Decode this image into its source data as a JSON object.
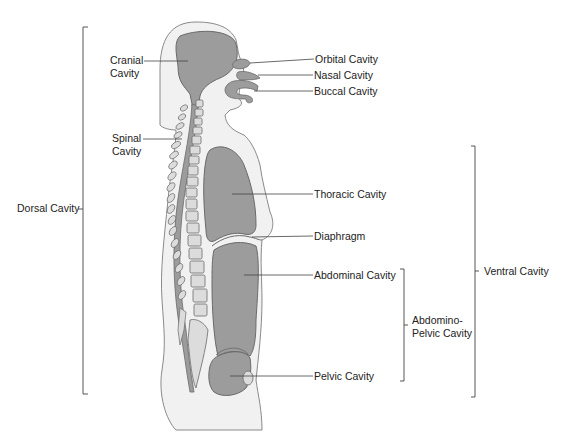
{
  "diagram": {
    "colors": {
      "background": "#ffffff",
      "body_fill": "#f1f1f1",
      "body_outline": "#8a8a8a",
      "cavity_fill": "#9c9c9c",
      "cavity_outline": "#6a6a6a",
      "vertebra_fill": "#dcdcdc",
      "line": "#444444"
    },
    "labels": {
      "cranial_line1": "Cranial",
      "cranial_line2": "Cavity",
      "spinal_line1": "Spinal",
      "spinal_line2": "Cavity",
      "dorsal": "Dorsal Cavity",
      "orbital": "Orbital Cavity",
      "nasal": "Nasal Cavity",
      "buccal": "Buccal Cavity",
      "thoracic": "Thoracic Cavity",
      "diaphragm": "Diaphragm",
      "abdominal": "Abdominal Cavity",
      "abdominopelvic_line1": "Abdomino-",
      "abdominopelvic_line2": "Pelvic Cavity",
      "pelvic": "Pelvic Cavity",
      "ventral": "Ventral Cavity"
    }
  }
}
